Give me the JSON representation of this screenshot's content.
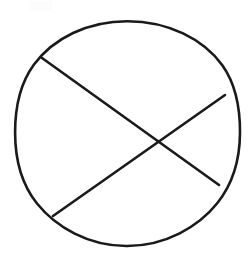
{
  "figure": {
    "background_color": "#ffffff",
    "stroke_color": "#1a1a1a",
    "stroke_width": 2.6,
    "canvas": {
      "width": 252,
      "height": 258
    },
    "caption": ""
  },
  "chart_data": {
    "type": "diagram",
    "xlabel": "",
    "ylabel": "",
    "xlim": [
      0,
      252
    ],
    "ylim": [
      0,
      258
    ],
    "grid": false,
    "legend": "none",
    "shapes": [
      {
        "name": "circle-outline",
        "type": "circle",
        "center": [
          127.5,
          133.5
        ],
        "radius_x": 112.5,
        "radius_y": 112.5,
        "bounds": {
          "left": 15,
          "top": 21,
          "right": 240,
          "bottom": 246
        },
        "stroke": "#1a1a1a",
        "stroke_width": 2.6,
        "fill": "none",
        "hand_drawn": true
      },
      {
        "name": "chord-upper-left-to-lower-right",
        "type": "line",
        "x1": 42,
        "y1": 58,
        "x2": 219,
        "y2": 185,
        "stroke": "#1a1a1a",
        "stroke_width": 2.6
      },
      {
        "name": "chord-lower-left-to-upper-right",
        "type": "line",
        "x1": 53,
        "y1": 216,
        "x2": 225,
        "y2": 95,
        "stroke": "#1a1a1a",
        "stroke_width": 2.6
      }
    ],
    "intersections": [
      {
        "name": "chord-crossing-point",
        "x": 161,
        "y": 139
      }
    ],
    "annotations": []
  }
}
